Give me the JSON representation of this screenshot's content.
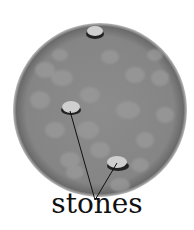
{
  "diagram": {
    "label": "stones",
    "circle": {
      "cx": 100,
      "cy": 110,
      "r": 87,
      "fill": "#8a8a8a",
      "edge": "#5e5e5e"
    },
    "stones": [
      {
        "name": "stone-top",
        "cx": 95,
        "cy": 32,
        "rx": 8,
        "ry": 5
      },
      {
        "name": "stone-middle",
        "cx": 71,
        "cy": 107,
        "rx": 9,
        "ry": 6
      },
      {
        "name": "stone-bottom",
        "cx": 118,
        "cy": 162,
        "rx": 10,
        "ry": 6
      }
    ],
    "pointer_origin": {
      "x": 95,
      "y": 200
    }
  }
}
